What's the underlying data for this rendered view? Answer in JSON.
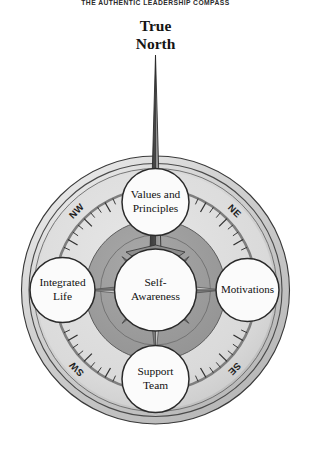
{
  "title": "THE AUTHENTIC LEADERSHIP COMPASS",
  "needle": {
    "label_line1": "True",
    "label_line2": "North",
    "icon": "compass-needle-icon"
  },
  "compass": {
    "center": {
      "label_line1": "Self-",
      "label_line2": "Awareness"
    },
    "nodes": [
      {
        "id": "north",
        "label_line1": "Values and",
        "label_line2": "Principles"
      },
      {
        "id": "east",
        "label_line1": "Motivations",
        "label_line2": ""
      },
      {
        "id": "south",
        "label_line1": "Support",
        "label_line2": "Team"
      },
      {
        "id": "west",
        "label_line1": "Integrated",
        "label_line2": "Life"
      }
    ],
    "bearings": [
      {
        "id": "nw",
        "label": "NW"
      },
      {
        "id": "ne",
        "label": "NE"
      },
      {
        "id": "se",
        "label": "SE"
      },
      {
        "id": "sw",
        "label": "SW"
      }
    ],
    "colors": {
      "page_background": "#ffffff",
      "outer_bevel": "#d4d4d4",
      "outer_band": "#cfcfcf",
      "dial_face": "#dcdcdc",
      "dial_rule": "#8a8a8a",
      "inner_disc": "#9d9d9d",
      "rose_light": "#c9c9c9",
      "rose_dark": "#7b7b7b",
      "node_fill": "#fbfbfb",
      "outline": "#2a2a2a",
      "needle_dark": "#3c3c3c",
      "needle_light": "#9a9a9a"
    }
  }
}
